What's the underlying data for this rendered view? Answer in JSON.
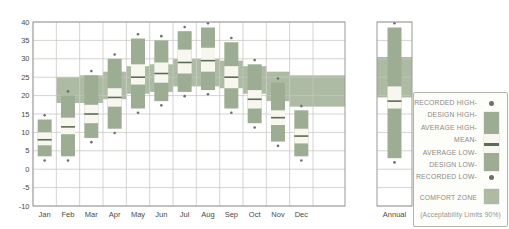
{
  "colors": {
    "comfort_zone": "#aebba4",
    "bar_green": "#9cad93",
    "bar_white": "#f7f6ef",
    "mean_line": "#5c6b57",
    "recorded_dot": "#6e6e6e",
    "gridline": "#c6c6c2",
    "plot_border": "#9a9a96",
    "axis_text": "#4a4a46"
  },
  "legend": {
    "items": [
      {
        "label": "RECORDED HIGH-",
        "symbol": "dot"
      },
      {
        "label": "DESIGN HIGH-",
        "symbol": "range-bar-top"
      },
      {
        "label": "AVERAGE HIGH-",
        "symbol": "range-bar"
      },
      {
        "label": "MEAN-",
        "symbol": "range-bar-mean"
      },
      {
        "label": "AVERAGE LOW-",
        "symbol": "range-bar"
      },
      {
        "label": "DESIGN LOW-",
        "symbol": "range-bar-bottom"
      },
      {
        "label": "RECORDED LOW-",
        "symbol": "dot"
      }
    ],
    "comfort_label": "COMFORT ZONE",
    "footnote": "(Acceptability Limits 90%)"
  },
  "x_axis": {
    "month_labels": [
      "Jan",
      "Feb",
      "Mar",
      "Apr",
      "May",
      "Jun",
      "Jul",
      "Aug",
      "Sep",
      "Oct",
      "Nov",
      "Dec"
    ],
    "annual_label": "Annual"
  },
  "y_axis": {
    "tick_labels": [
      "40",
      "35",
      "30",
      "25",
      "20",
      "15",
      "10",
      "5",
      "0",
      "-5",
      "-10"
    ],
    "ticks": [
      40,
      35,
      30,
      25,
      20,
      15,
      10,
      5,
      0,
      -5,
      -10
    ],
    "min": -10,
    "max": 40
  },
  "chart_data": {
    "type": "bar",
    "categories": [
      "Jan",
      "Feb",
      "Mar",
      "Apr",
      "May",
      "Jun",
      "Jul",
      "Aug",
      "Sep",
      "Oct",
      "Nov",
      "Dec",
      "Annual"
    ],
    "xlabel": "",
    "ylabel": "Temperature (deg C)",
    "ylim": [
      -10,
      40
    ],
    "grid": true,
    "legend_position": "right",
    "series": [
      {
        "name": "recorded_high",
        "values": [
          14,
          20.5,
          26,
          30.5,
          36,
          35.5,
          38,
          39,
          35,
          29,
          24,
          16.5,
          39
        ]
      },
      {
        "name": "design_high",
        "values": [
          13.5,
          20,
          25.5,
          30,
          35.5,
          35,
          37.5,
          38.5,
          34.5,
          28.5,
          23.5,
          16,
          38.5
        ]
      },
      {
        "name": "average_high",
        "values": [
          10,
          14,
          17.5,
          22,
          28.5,
          29,
          32.5,
          33,
          28,
          21.5,
          16,
          11,
          22.5
        ]
      },
      {
        "name": "mean",
        "values": [
          8,
          11.5,
          15,
          19.5,
          25,
          26,
          29,
          29.5,
          25,
          19,
          14,
          9,
          18.5
        ]
      },
      {
        "name": "average_low",
        "values": [
          6.5,
          9.5,
          12.5,
          17,
          23,
          23.5,
          26,
          26.5,
          22,
          16.5,
          12,
          7,
          16.5
        ]
      },
      {
        "name": "design_low",
        "values": [
          3.5,
          3.5,
          8.5,
          11,
          16.5,
          18.5,
          21,
          21.5,
          16.5,
          12.5,
          7.5,
          3.5,
          3
        ]
      },
      {
        "name": "recorded_low",
        "values": [
          3,
          3,
          8,
          10.5,
          16,
          18,
          20.5,
          21,
          16,
          12,
          7,
          3,
          2.5
        ]
      },
      {
        "name": "comfort_zone_low",
        "values": [
          null,
          18,
          18,
          19,
          20.5,
          21,
          22.5,
          22.5,
          22,
          20.5,
          18.5,
          17,
          19.5
        ]
      },
      {
        "name": "comfort_zone_high",
        "values": [
          null,
          25,
          25.5,
          26.5,
          28,
          28.5,
          30,
          30,
          29.5,
          28,
          26.5,
          25.5,
          30.5
        ]
      }
    ]
  }
}
